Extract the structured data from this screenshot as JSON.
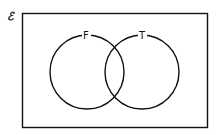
{
  "diagram": {
    "type": "venn",
    "universal_set_symbol": "ℰ",
    "sets": [
      {
        "label": "F"
      },
      {
        "label": "T"
      }
    ],
    "stroke_color": "#111111",
    "background": "#ffffff"
  }
}
